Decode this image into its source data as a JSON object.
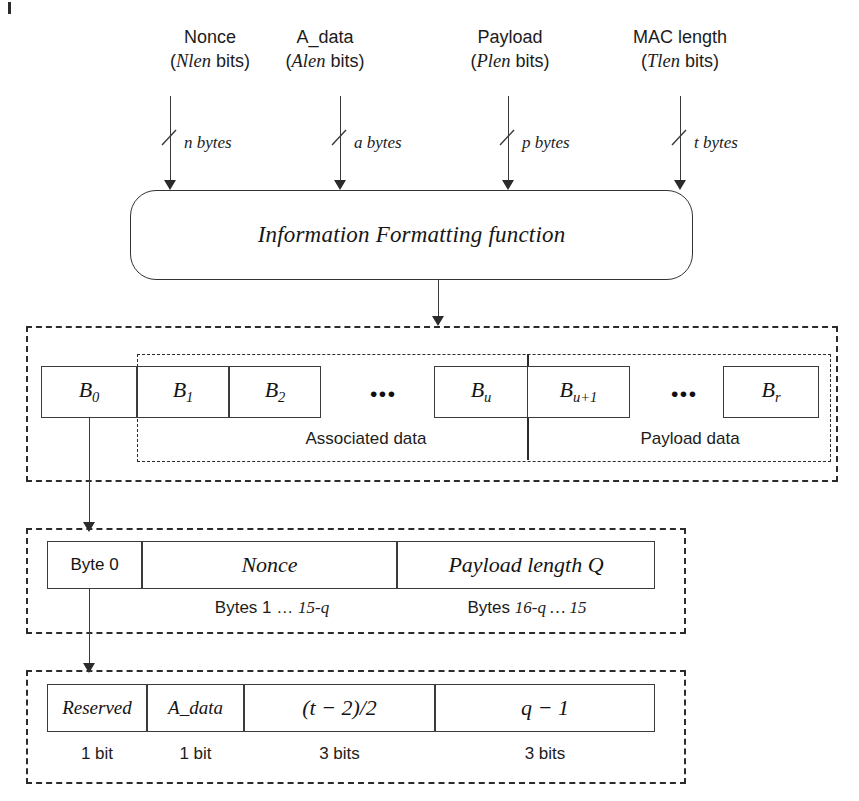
{
  "figure": {
    "inputs": [
      {
        "name": "Nonce",
        "line1": "Nonce",
        "param": "Nlen",
        "line2_suffix": " bits)",
        "size_label": "n bytes",
        "icon": "slash-tick-icon"
      },
      {
        "name": "A_data",
        "line1": "A_data",
        "param": "Alen",
        "line2_suffix": " bits)",
        "size_label": "a bytes",
        "icon": "slash-tick-icon"
      },
      {
        "name": "Payload",
        "line1": "Payload",
        "param": "Plen",
        "line2_suffix": " bits)",
        "size_label": "p bytes",
        "icon": "slash-tick-icon"
      },
      {
        "name": "MAC length",
        "line1": "MAC length",
        "param": "Tlen",
        "line2_suffix": " bits)",
        "size_label": "t bytes",
        "icon": "slash-tick-icon"
      }
    ],
    "function_box": {
      "label": "Information Formatting function"
    },
    "blocks_row": {
      "blocks": [
        {
          "id": "B0",
          "base": "B",
          "sub": "0"
        },
        {
          "id": "B1",
          "base": "B",
          "sub": "1"
        },
        {
          "id": "B2",
          "base": "B",
          "sub": "2"
        },
        {
          "id": "Bu",
          "base": "B",
          "sub": "u"
        },
        {
          "id": "Bu1",
          "base": "B",
          "sub": "u+1"
        },
        {
          "id": "Br",
          "base": "B",
          "sub": "r"
        }
      ],
      "ellipsis": "•••",
      "group_labels": {
        "associated": "Associated data",
        "payload": "Payload data"
      }
    },
    "b0_expansion": {
      "fields": [
        {
          "id": "byte0",
          "label": "Byte 0",
          "style": "sans"
        },
        {
          "id": "nonce",
          "label": "Nonce",
          "style": "italic"
        },
        {
          "id": "qlen",
          "label": "Payload length Q",
          "style": "italic"
        }
      ],
      "captions": [
        {
          "id": "nonce-bytes",
          "prefix": "Bytes 1 … ",
          "emphasis": "15-q",
          "suffix": ""
        },
        {
          "id": "q-bytes",
          "prefix": "Bytes ",
          "emphasis": "16-q … 15",
          "suffix": ""
        }
      ]
    },
    "byte0_expansion": {
      "fields": [
        {
          "id": "reserved",
          "label": "Reserved",
          "bits": "1 bit"
        },
        {
          "id": "adata",
          "label": "A_data",
          "bits": "1 bit"
        },
        {
          "id": "tfield",
          "label": "(t − 2)/2",
          "bits": "3 bits"
        },
        {
          "id": "qfield",
          "label": "q − 1",
          "bits": "3 bits"
        }
      ]
    },
    "colors": {
      "stroke": "#3b3b3b",
      "dashed": "#2c2c2c",
      "text": "#1a1a1a",
      "background": "#ffffff"
    }
  }
}
